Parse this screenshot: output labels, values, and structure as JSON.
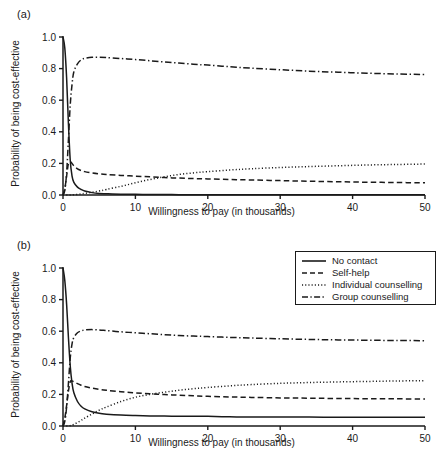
{
  "figure": {
    "panels": [
      {
        "key": "a",
        "label": "(a)"
      },
      {
        "key": "b",
        "label": "(b)"
      }
    ]
  },
  "legend": {
    "position": "top-right-panel-b",
    "entries": [
      {
        "label": "No contact",
        "style": "solid"
      },
      {
        "label": "Self-help",
        "style": "dashed"
      },
      {
        "label": "Individual counselling",
        "style": "dotted"
      },
      {
        "label": "Group counselling",
        "style": "dashdot"
      }
    ]
  },
  "chart_data": [
    {
      "type": "line",
      "panel": "(a)",
      "title": "",
      "xlabel": "Willingness to pay (in thousands)",
      "ylabel": "Probability of being cost-effective",
      "xlim": [
        0,
        50
      ],
      "ylim": [
        0,
        1.0
      ],
      "xticks": [
        0,
        10,
        20,
        30,
        40,
        50
      ],
      "yticks": [
        0.0,
        0.2,
        0.4,
        0.6,
        0.8,
        1.0
      ],
      "xticklabels": [
        "0",
        "10",
        "20",
        "30",
        "40",
        "50"
      ],
      "yticklabels": [
        "0.0",
        "0.2",
        "0.4",
        "0.6",
        "0.8",
        "1.0"
      ],
      "grid": false,
      "x": [
        0,
        0.25,
        0.5,
        0.75,
        1,
        1.25,
        1.5,
        2,
        2.5,
        3,
        4,
        5,
        6,
        8,
        10,
        12,
        14,
        16,
        18,
        20,
        23,
        26,
        30,
        34,
        38,
        42,
        46,
        50
      ],
      "series": [
        {
          "name": "No contact",
          "style": "solid",
          "values": [
            1.0,
            0.93,
            0.74,
            0.45,
            0.22,
            0.12,
            0.08,
            0.05,
            0.035,
            0.025,
            0.015,
            0.01,
            0.008,
            0.005,
            0.004,
            0.003,
            0.003,
            0.002,
            0.002,
            0.002,
            0.002,
            0.002,
            0.001,
            0.001,
            0.001,
            0.001,
            0.001,
            0.001
          ]
        },
        {
          "name": "Self-help",
          "style": "dashed",
          "values": [
            0.0,
            0.04,
            0.12,
            0.2,
            0.21,
            0.2,
            0.185,
            0.165,
            0.155,
            0.148,
            0.14,
            0.134,
            0.13,
            0.124,
            0.119,
            0.115,
            0.11,
            0.107,
            0.104,
            0.102,
            0.098,
            0.095,
            0.091,
            0.087,
            0.084,
            0.081,
            0.079,
            0.077
          ]
        },
        {
          "name": "Individual counselling",
          "style": "dotted",
          "values": [
            0.0,
            0.0,
            0.0,
            0.0,
            0.0,
            0.0,
            0.002,
            0.004,
            0.007,
            0.01,
            0.017,
            0.025,
            0.035,
            0.055,
            0.077,
            0.098,
            0.115,
            0.13,
            0.14,
            0.148,
            0.158,
            0.166,
            0.174,
            0.18,
            0.185,
            0.19,
            0.193,
            0.196
          ]
        },
        {
          "name": "Group counselling",
          "style": "dashdot",
          "values": [
            0.0,
            0.03,
            0.14,
            0.35,
            0.57,
            0.7,
            0.78,
            0.83,
            0.855,
            0.865,
            0.872,
            0.872,
            0.87,
            0.864,
            0.857,
            0.85,
            0.842,
            0.835,
            0.828,
            0.822,
            0.812,
            0.803,
            0.793,
            0.784,
            0.777,
            0.771,
            0.766,
            0.762
          ]
        }
      ]
    },
    {
      "type": "line",
      "panel": "(b)",
      "title": "",
      "xlabel": "Willingness to pay (in thousands)",
      "ylabel": "Probability of being cost-effective",
      "xlim": [
        0,
        50
      ],
      "ylim": [
        0,
        1.0
      ],
      "xticks": [
        0,
        10,
        20,
        30,
        40,
        50
      ],
      "yticks": [
        0.0,
        0.2,
        0.4,
        0.6,
        0.8,
        1.0
      ],
      "xticklabels": [
        "0",
        "10",
        "20",
        "30",
        "40",
        "50"
      ],
      "yticklabels": [
        "0.0",
        "0.2",
        "0.4",
        "0.6",
        "0.8",
        "1.0"
      ],
      "grid": false,
      "x": [
        0,
        0.25,
        0.5,
        0.75,
        1,
        1.25,
        1.5,
        2,
        2.5,
        3,
        4,
        5,
        6,
        8,
        10,
        12,
        14,
        16,
        18,
        20,
        23,
        26,
        30,
        34,
        38,
        42,
        46,
        50
      ],
      "series": [
        {
          "name": "No contact",
          "style": "solid",
          "values": [
            1.0,
            0.92,
            0.77,
            0.56,
            0.38,
            0.27,
            0.21,
            0.155,
            0.125,
            0.108,
            0.09,
            0.08,
            0.075,
            0.069,
            0.066,
            0.064,
            0.063,
            0.062,
            0.062,
            0.061,
            0.058,
            0.057,
            0.057,
            0.057,
            0.055,
            0.055,
            0.055,
            0.055
          ]
        },
        {
          "name": "Self-help",
          "style": "dashed",
          "values": [
            0.0,
            0.05,
            0.13,
            0.22,
            0.28,
            0.285,
            0.28,
            0.268,
            0.258,
            0.25,
            0.24,
            0.232,
            0.226,
            0.217,
            0.21,
            0.204,
            0.199,
            0.195,
            0.191,
            0.188,
            0.184,
            0.181,
            0.178,
            0.176,
            0.174,
            0.173,
            0.172,
            0.171
          ]
        },
        {
          "name": "Individual counselling",
          "style": "dotted",
          "values": [
            0.0,
            0.0,
            0.0,
            0.0,
            0.002,
            0.005,
            0.01,
            0.022,
            0.035,
            0.05,
            0.075,
            0.1,
            0.12,
            0.155,
            0.182,
            0.2,
            0.214,
            0.226,
            0.236,
            0.244,
            0.254,
            0.262,
            0.27,
            0.275,
            0.279,
            0.282,
            0.285,
            0.287
          ]
        },
        {
          "name": "Group counselling",
          "style": "dashdot",
          "values": [
            0.0,
            0.03,
            0.12,
            0.27,
            0.43,
            0.52,
            0.56,
            0.59,
            0.602,
            0.608,
            0.61,
            0.608,
            0.604,
            0.596,
            0.59,
            0.584,
            0.578,
            0.573,
            0.569,
            0.566,
            0.561,
            0.557,
            0.552,
            0.548,
            0.545,
            0.543,
            0.541,
            0.54
          ]
        }
      ]
    }
  ]
}
